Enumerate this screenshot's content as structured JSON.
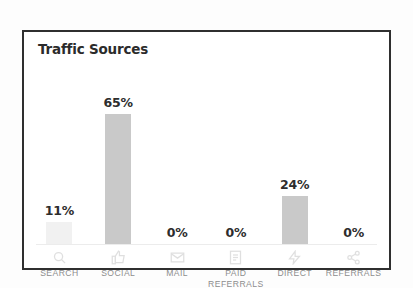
{
  "card": {
    "title": "Traffic Sources",
    "border_color": "#2f2f2f",
    "background": "#ffffff"
  },
  "chart_data": {
    "type": "bar",
    "title": "Traffic Sources",
    "xlabel": "",
    "ylabel": "",
    "ylim": [
      0,
      70
    ],
    "grid": false,
    "legend": null,
    "categories": [
      "SEARCH",
      "SOCIAL",
      "MAIL",
      "PAID REFERRALS",
      "DIRECT",
      "REFERRALS"
    ],
    "values": [
      11,
      65,
      0,
      0,
      24,
      0
    ],
    "value_labels": [
      "11%",
      "65%",
      "0%",
      "0%",
      "24%",
      "0%"
    ],
    "bar_color": "#c9c9c9",
    "faint_bar_color": "#f1f1f1",
    "value_label_color": "#2d2d2d",
    "category_label_color": "#8d8d8d"
  },
  "categories": [
    {
      "label": "SEARCH",
      "label_line2": "",
      "value_label": "11%",
      "value": 11,
      "icon": "search-icon",
      "faint": true
    },
    {
      "label": "SOCIAL",
      "label_line2": "",
      "value_label": "65%",
      "value": 65,
      "icon": "thumbs-up-icon",
      "faint": false
    },
    {
      "label": "MAIL",
      "label_line2": "",
      "value_label": "0%",
      "value": 0,
      "icon": "envelope-icon",
      "faint": false
    },
    {
      "label": "PAID",
      "label_line2": "REFERRALS",
      "value_label": "0%",
      "value": 0,
      "icon": "document-icon",
      "faint": false
    },
    {
      "label": "DIRECT",
      "label_line2": "",
      "value_label": "24%",
      "value": 24,
      "icon": "bolt-icon",
      "faint": false
    },
    {
      "label": "REFERRALS",
      "label_line2": "",
      "value_label": "0%",
      "value": 0,
      "icon": "share-icon",
      "faint": false
    }
  ]
}
